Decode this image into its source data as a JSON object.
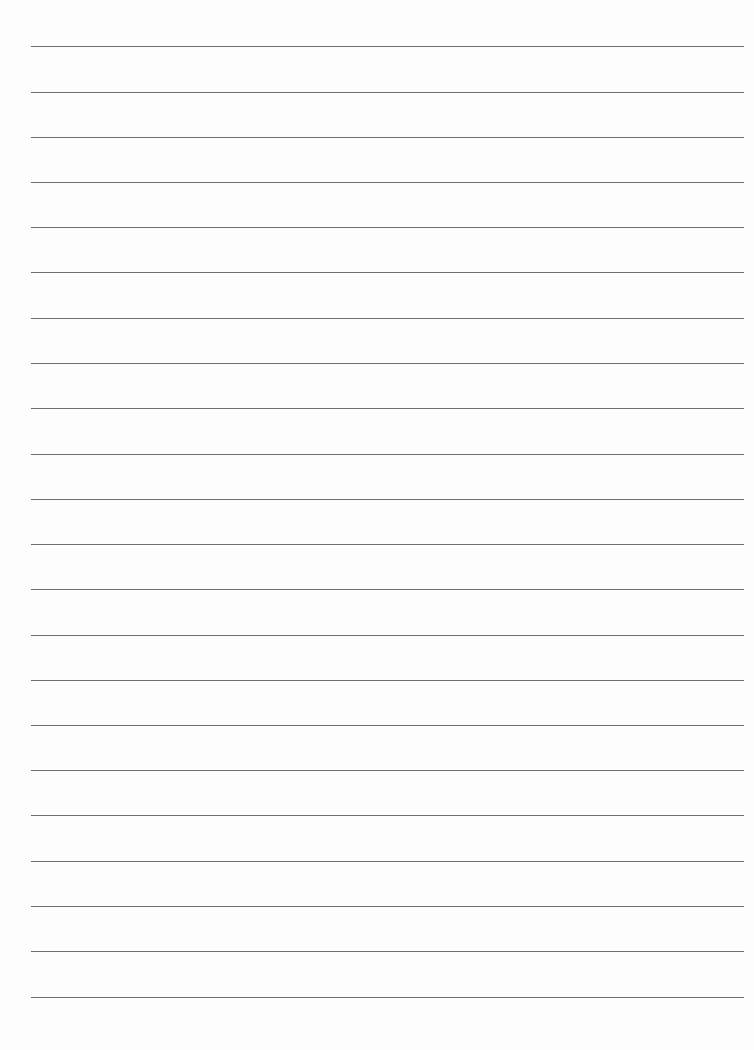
{
  "document": {
    "type": "lined-paper",
    "background_color": "#fdfdfd",
    "rule_color": "#6e6e6e",
    "rule_count": 22,
    "rule_left_px": 31,
    "rule_right_px": 744,
    "first_rule_y_px": 46,
    "rule_spacing_px": 45.3,
    "rules": [
      {
        "y": 46
      },
      {
        "y": 92
      },
      {
        "y": 137
      },
      {
        "y": 182
      },
      {
        "y": 227
      },
      {
        "y": 272
      },
      {
        "y": 318
      },
      {
        "y": 363
      },
      {
        "y": 408
      },
      {
        "y": 454
      },
      {
        "y": 499
      },
      {
        "y": 544
      },
      {
        "y": 589
      },
      {
        "y": 635
      },
      {
        "y": 680
      },
      {
        "y": 725
      },
      {
        "y": 770
      },
      {
        "y": 815
      },
      {
        "y": 861
      },
      {
        "y": 906
      },
      {
        "y": 951
      },
      {
        "y": 997
      }
    ]
  }
}
